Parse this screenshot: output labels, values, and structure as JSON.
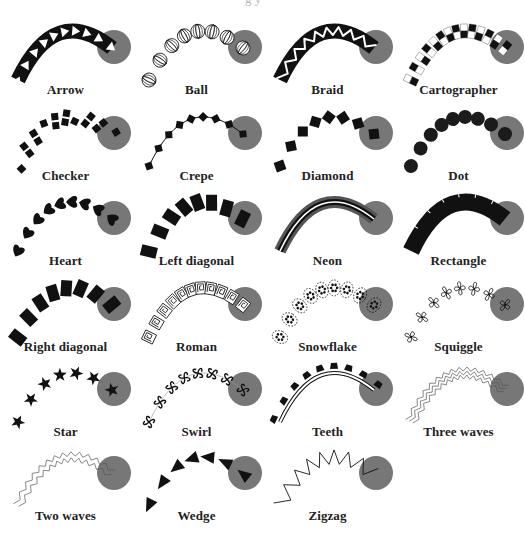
{
  "gallery": {
    "title_cropped": "g    y",
    "circle_color": "#777777",
    "stroke_color": "#111111",
    "columns": 4,
    "items": [
      {
        "label": "Arrow",
        "style": "arrow"
      },
      {
        "label": "Ball",
        "style": "ball"
      },
      {
        "label": "Braid",
        "style": "braid"
      },
      {
        "label": "Cartographer",
        "style": "cartographer"
      },
      {
        "label": "Checker",
        "style": "checker"
      },
      {
        "label": "Crepe",
        "style": "crepe"
      },
      {
        "label": "Diamond",
        "style": "diamond"
      },
      {
        "label": "Dot",
        "style": "dot"
      },
      {
        "label": "Heart",
        "style": "heart"
      },
      {
        "label": "Left diagonal",
        "style": "left-diagonal"
      },
      {
        "label": "Neon",
        "style": "neon"
      },
      {
        "label": "Rectangle",
        "style": "rectangle"
      },
      {
        "label": "Right diagonal",
        "style": "right-diagonal"
      },
      {
        "label": "Roman",
        "style": "roman"
      },
      {
        "label": "Snowflake",
        "style": "snowflake"
      },
      {
        "label": "Squiggle",
        "style": "squiggle"
      },
      {
        "label": "Star",
        "style": "star"
      },
      {
        "label": "Swirl",
        "style": "swirl"
      },
      {
        "label": "Teeth",
        "style": "teeth"
      },
      {
        "label": "Three waves",
        "style": "three-waves"
      },
      {
        "label": "Two waves",
        "style": "two-waves"
      },
      {
        "label": "Wedge",
        "style": "wedge"
      },
      {
        "label": "Zigzag",
        "style": "zigzag"
      }
    ]
  }
}
